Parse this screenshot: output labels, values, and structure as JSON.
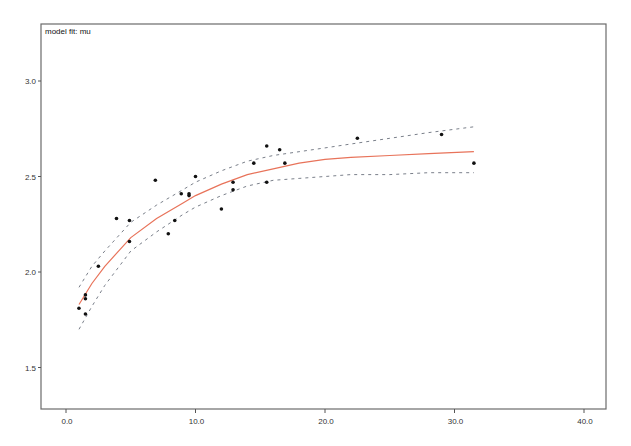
{
  "chart_data": {
    "type": "scatter",
    "title": "model fit: mu",
    "xlabel": "",
    "ylabel": "",
    "xlim": [
      -2.0,
      42.0
    ],
    "ylim": [
      1.28,
      3.3
    ],
    "x_ticks": [
      0.0,
      10.0,
      20.0,
      30.0,
      40.0
    ],
    "x_tick_labels": [
      "0.0",
      "10.0",
      "20.0",
      "30.0",
      "40.0"
    ],
    "y_ticks": [
      1.5,
      2.0,
      2.5,
      3.0
    ],
    "y_tick_labels": [
      "1.5",
      "2.0",
      "2.5",
      "3.0"
    ],
    "grid": false,
    "legend": null,
    "series": [
      {
        "name": "observed",
        "type": "scatter",
        "color": "#111111",
        "points": [
          {
            "x": 1.0,
            "y": 1.81
          },
          {
            "x": 1.5,
            "y": 1.88
          },
          {
            "x": 1.5,
            "y": 1.86
          },
          {
            "x": 1.5,
            "y": 1.78
          },
          {
            "x": 2.5,
            "y": 2.03
          },
          {
            "x": 3.9,
            "y": 2.28
          },
          {
            "x": 4.9,
            "y": 2.27
          },
          {
            "x": 4.9,
            "y": 2.16
          },
          {
            "x": 6.9,
            "y": 2.48
          },
          {
            "x": 7.9,
            "y": 2.2
          },
          {
            "x": 8.4,
            "y": 2.27
          },
          {
            "x": 8.9,
            "y": 2.41
          },
          {
            "x": 9.5,
            "y": 2.41
          },
          {
            "x": 9.5,
            "y": 2.4
          },
          {
            "x": 10.0,
            "y": 2.5
          },
          {
            "x": 12.0,
            "y": 2.33
          },
          {
            "x": 12.9,
            "y": 2.47
          },
          {
            "x": 12.9,
            "y": 2.43
          },
          {
            "x": 14.5,
            "y": 2.57
          },
          {
            "x": 15.5,
            "y": 2.66
          },
          {
            "x": 15.5,
            "y": 2.47
          },
          {
            "x": 16.5,
            "y": 2.64
          },
          {
            "x": 16.9,
            "y": 2.57
          },
          {
            "x": 22.5,
            "y": 2.7
          },
          {
            "x": 29.0,
            "y": 2.72
          },
          {
            "x": 31.5,
            "y": 2.57
          }
        ]
      },
      {
        "name": "fitted mu",
        "type": "line",
        "color": "#e8735a",
        "x": [
          1.0,
          2.0,
          3.0,
          5.0,
          7.0,
          9.0,
          10.0,
          12.0,
          14.0,
          16.0,
          18.0,
          20.0,
          22.0,
          25.0,
          28.0,
          31.5
        ],
        "y": [
          1.83,
          1.94,
          2.03,
          2.18,
          2.28,
          2.36,
          2.4,
          2.46,
          2.51,
          2.54,
          2.57,
          2.59,
          2.6,
          2.61,
          2.62,
          2.63
        ]
      },
      {
        "name": "upper band",
        "type": "line",
        "style": "dashed",
        "color": "#7a7f8a",
        "x": [
          1.0,
          2.0,
          3.0,
          5.0,
          7.0,
          9.0,
          10.0,
          12.0,
          14.0,
          16.0,
          18.0,
          20.0,
          22.0,
          25.0,
          28.0,
          31.5
        ],
        "y": [
          1.92,
          2.03,
          2.11,
          2.26,
          2.35,
          2.43,
          2.47,
          2.53,
          2.58,
          2.61,
          2.63,
          2.65,
          2.67,
          2.7,
          2.73,
          2.76
        ]
      },
      {
        "name": "lower band",
        "type": "line",
        "style": "dashed",
        "color": "#7a7f8a",
        "x": [
          1.0,
          2.0,
          3.0,
          5.0,
          7.0,
          9.0,
          10.0,
          12.0,
          14.0,
          16.0,
          18.0,
          20.0,
          22.0,
          25.0,
          28.0,
          31.5
        ],
        "y": [
          1.7,
          1.82,
          1.93,
          2.11,
          2.21,
          2.3,
          2.34,
          2.4,
          2.45,
          2.48,
          2.49,
          2.5,
          2.51,
          2.51,
          2.52,
          2.52
        ]
      }
    ]
  }
}
